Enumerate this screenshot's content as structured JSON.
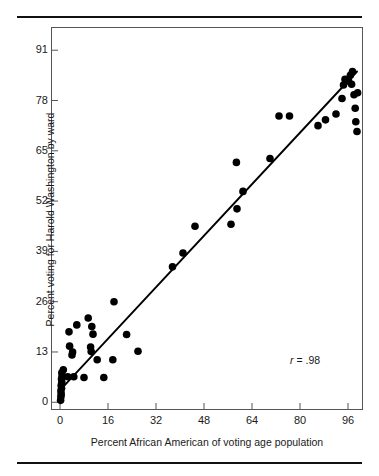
{
  "figure": {
    "background_color": "#ffffff",
    "rule_color": "#111111",
    "frame_color": "#555555",
    "ink_color": "#000000"
  },
  "axis_titles": {
    "x": "Percent African American of voting age population",
    "y": "Percent voting for Harold Washington by ward"
  },
  "annotation": {
    "r_symbol": "r",
    "r_text": "= .98",
    "full": "r = .98"
  },
  "chart_data": {
    "type": "scatter",
    "title": "",
    "xlabel": "Percent African American of voting age population",
    "ylabel": "Percent voting for Harold Washington by ward",
    "xlim": [
      -3,
      101
    ],
    "ylim": [
      -2,
      97
    ],
    "xticks": [
      0,
      16,
      32,
      48,
      64,
      80,
      96
    ],
    "yticks": [
      0,
      13,
      26,
      39,
      52,
      65,
      78,
      91
    ],
    "grid": false,
    "legend": null,
    "annotations": [
      {
        "text": "r = .98",
        "x": 84,
        "y": 11
      }
    ],
    "correlation": 0.98,
    "trendline": {
      "type": "linear",
      "x": [
        0.5,
        99.0
      ],
      "y": [
        3.5,
        85.5
      ]
    },
    "marker": {
      "shape": "circle",
      "color": "#000000",
      "size": 5
    },
    "points": [
      {
        "x": 0.2,
        "y": 0.5
      },
      {
        "x": 0.3,
        "y": 1.4
      },
      {
        "x": 0.4,
        "y": 2.1
      },
      {
        "x": 0.3,
        "y": 2.9
      },
      {
        "x": 0.5,
        "y": 3.6
      },
      {
        "x": 0.4,
        "y": 4.4
      },
      {
        "x": 0.6,
        "y": 5.2
      },
      {
        "x": 0.5,
        "y": 6.0
      },
      {
        "x": 0.7,
        "y": 6.8
      },
      {
        "x": 0.6,
        "y": 7.6
      },
      {
        "x": 1.1,
        "y": 8.4
      },
      {
        "x": 2.6,
        "y": 6.6
      },
      {
        "x": 4.6,
        "y": 6.6
      },
      {
        "x": 8.0,
        "y": 6.4
      },
      {
        "x": 14.6,
        "y": 6.4
      },
      {
        "x": 4.0,
        "y": 12.2
      },
      {
        "x": 4.2,
        "y": 13.0
      },
      {
        "x": 3.2,
        "y": 14.5
      },
      {
        "x": 3.0,
        "y": 18.2
      },
      {
        "x": 5.6,
        "y": 20.0
      },
      {
        "x": 9.4,
        "y": 21.8
      },
      {
        "x": 10.6,
        "y": 19.6
      },
      {
        "x": 11.0,
        "y": 17.6
      },
      {
        "x": 10.2,
        "y": 14.3
      },
      {
        "x": 10.4,
        "y": 13.1
      },
      {
        "x": 12.4,
        "y": 11.0
      },
      {
        "x": 17.6,
        "y": 11.0
      },
      {
        "x": 18.0,
        "y": 26.0
      },
      {
        "x": 22.2,
        "y": 17.5
      },
      {
        "x": 26.0,
        "y": 13.2
      },
      {
        "x": 37.5,
        "y": 35.0
      },
      {
        "x": 41.0,
        "y": 38.6
      },
      {
        "x": 45.0,
        "y": 45.5
      },
      {
        "x": 57.0,
        "y": 46.0
      },
      {
        "x": 58.8,
        "y": 62.0
      },
      {
        "x": 61.0,
        "y": 54.5
      },
      {
        "x": 59.0,
        "y": 50.0
      },
      {
        "x": 70.0,
        "y": 63.0
      },
      {
        "x": 73.0,
        "y": 74.0
      },
      {
        "x": 76.5,
        "y": 74.0
      },
      {
        "x": 86.0,
        "y": 71.5
      },
      {
        "x": 88.5,
        "y": 73.0
      },
      {
        "x": 92.0,
        "y": 74.5
      },
      {
        "x": 94.0,
        "y": 78.5
      },
      {
        "x": 94.5,
        "y": 82.0
      },
      {
        "x": 95.0,
        "y": 83.5
      },
      {
        "x": 96.2,
        "y": 83.0
      },
      {
        "x": 96.8,
        "y": 84.5
      },
      {
        "x": 97.2,
        "y": 82.2
      },
      {
        "x": 97.5,
        "y": 85.5
      },
      {
        "x": 98.0,
        "y": 79.5
      },
      {
        "x": 98.4,
        "y": 76.0
      },
      {
        "x": 98.6,
        "y": 72.5
      },
      {
        "x": 99.0,
        "y": 70.0
      },
      {
        "x": 99.2,
        "y": 80.0
      }
    ]
  }
}
